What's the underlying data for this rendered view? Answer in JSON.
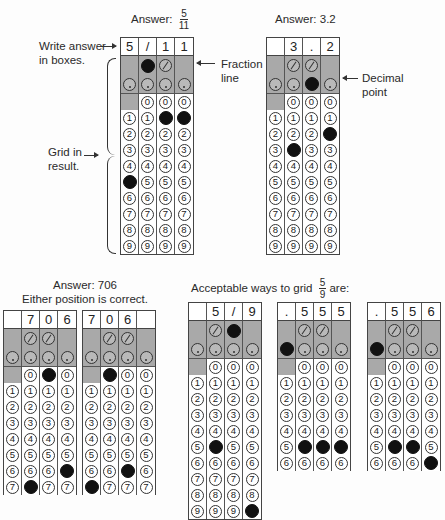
{
  "examples": [
    {
      "id": "g1",
      "caption": "Answer:",
      "caption_fraction": {
        "num": "5",
        "den": "11"
      },
      "header": [
        "5",
        "/",
        "1",
        "1"
      ],
      "slash_filled": [
        false,
        true,
        false,
        false
      ],
      "dot_filled": [
        false,
        false,
        false,
        false
      ],
      "digit_filled": [
        5,
        null,
        1,
        1
      ],
      "rows": 10
    },
    {
      "id": "g2",
      "caption": "Answer: 3.2",
      "header": [
        "",
        "3",
        ".",
        "2"
      ],
      "slash_filled": [
        false,
        false,
        false,
        false
      ],
      "dot_filled": [
        false,
        false,
        true,
        false
      ],
      "digit_filled": [
        null,
        3,
        null,
        2
      ],
      "rows": 10
    },
    {
      "id": "g3",
      "caption": "Answer: 706",
      "caption2": "Either position is correct.",
      "header": [
        "",
        "7",
        "0",
        "6"
      ],
      "slash_filled": [
        false,
        false,
        false,
        false
      ],
      "dot_filled": [
        false,
        false,
        false,
        false
      ],
      "digit_filled": [
        null,
        7,
        0,
        6
      ],
      "rows": 8
    },
    {
      "id": "g4",
      "header": [
        "7",
        "0",
        "6",
        ""
      ],
      "slash_filled": [
        false,
        false,
        false,
        false
      ],
      "dot_filled": [
        false,
        false,
        false,
        false
      ],
      "digit_filled": [
        7,
        0,
        6,
        null
      ],
      "rows": 8
    },
    {
      "id": "g5",
      "caption": "Acceptable ways to grid",
      "caption_fraction": {
        "num": "5",
        "den": "9"
      },
      "caption_suffix": "are:",
      "header": [
        "",
        "5",
        "/",
        "9"
      ],
      "slash_filled": [
        false,
        false,
        true,
        false
      ],
      "dot_filled": [
        false,
        false,
        false,
        false
      ],
      "digit_filled": [
        null,
        5,
        null,
        9
      ],
      "rows": 10
    },
    {
      "id": "g6",
      "header": [
        ".",
        "5",
        "5",
        "5"
      ],
      "slash_filled": [
        false,
        false,
        false,
        false
      ],
      "dot_filled": [
        true,
        false,
        false,
        false
      ],
      "digit_filled": [
        null,
        5,
        5,
        5
      ],
      "rows": 7
    },
    {
      "id": "g7",
      "header": [
        ".",
        "5",
        "5",
        "6"
      ],
      "slash_filled": [
        false,
        false,
        false,
        false
      ],
      "dot_filled": [
        true,
        false,
        false,
        false
      ],
      "digit_filled": [
        null,
        5,
        5,
        6
      ],
      "rows": 7
    }
  ],
  "annotations": {
    "write_answer": [
      "Write answer",
      "in boxes."
    ],
    "grid_in": [
      "Grid in",
      "result."
    ],
    "fraction_line": [
      "Fraction",
      "line"
    ],
    "decimal_point": [
      "Decimal",
      "point"
    ]
  }
}
